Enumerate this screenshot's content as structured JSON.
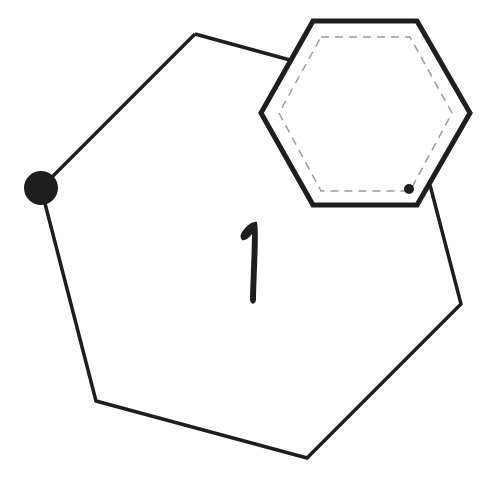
{
  "diagram": {
    "label": "1",
    "colors": {
      "stroke": "#1e1e1e",
      "dashed": "#9a9a9a",
      "background": "#ffffff"
    },
    "big_polygon": {
      "points": "195,34 290,60 430,185 461,304 307,458 96,401 41,188"
    },
    "small_hexagon": {
      "outer_points": "313,21 417,21 470,113 417,205 313,205 261,113",
      "inner_points": "321,37 410,37 452,113 410,191 321,191 279,113"
    },
    "node": {
      "cx": 41,
      "cy": 188,
      "r": 17
    },
    "small_dot": {
      "cx": 409,
      "cy": 189,
      "r": 5
    }
  }
}
